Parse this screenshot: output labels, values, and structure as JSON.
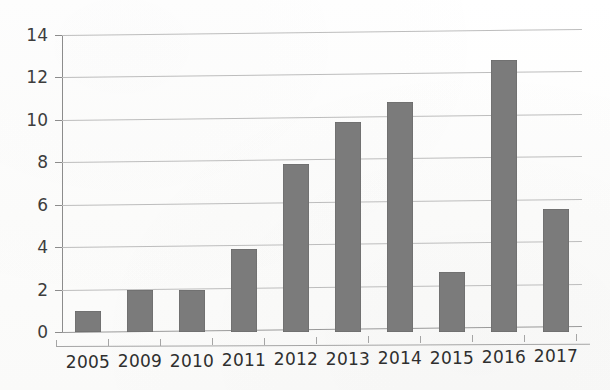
{
  "chart_data": {
    "type": "bar",
    "title": "",
    "subtitle": "",
    "xlabel": "",
    "ylabel": "",
    "categories": [
      "2005",
      "2009",
      "2010",
      "2011",
      "2012",
      "2013",
      "2014",
      "2015",
      "2016",
      "2017"
    ],
    "values": [
      1.0,
      2.0,
      2.0,
      3.9,
      7.9,
      9.9,
      10.85,
      2.85,
      12.8,
      5.8
    ],
    "series": [
      {
        "name": "",
        "values": [
          1.0,
          2.0,
          2.0,
          3.9,
          7.9,
          9.9,
          10.85,
          2.85,
          12.8,
          5.8
        ]
      }
    ],
    "ylim": [
      0,
      14
    ],
    "ytick_labels": [
      "0",
      "2",
      "4",
      "6",
      "8",
      "10",
      "12",
      "14"
    ],
    "ytick_values": [
      0,
      2,
      4,
      6,
      8,
      10,
      12,
      14
    ],
    "grid": true,
    "legend": "none",
    "bar_color": "#7b7b7b",
    "gridline_color": "#bdbdbd",
    "axis_color": "#8c8c8c",
    "background_color": "#fdfdfc",
    "text_color": "#2f2f2f"
  }
}
